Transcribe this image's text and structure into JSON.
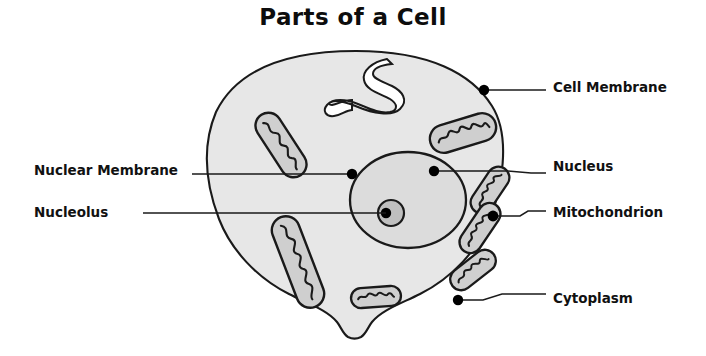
{
  "title": "Parts of a Cell",
  "colors": {
    "background": "#ffffff",
    "cytoplasm_fill": "#e7e7e7",
    "nucleus_fill": "#dcdcdc",
    "nucleolus_fill": "#bfbfbf",
    "mitochondrion_fill": "#cfcfcf",
    "organelle_channel_fill": "#ffffff",
    "outline": "#1a1a1a",
    "label_text": "#111111",
    "title_text": "#0d0d0d",
    "leader_line": "#1a1a1a",
    "anchor_dot": "#000000"
  },
  "labels": [
    {
      "id": "cell-membrane",
      "text": "Cell Membrane",
      "side": "right",
      "text_x": 553,
      "text_y": 88,
      "dot_x": 484,
      "dot_y": 90,
      "line_points": "484,90 546,90"
    },
    {
      "id": "nucleus",
      "text": "Nucleus",
      "side": "right",
      "text_x": 553,
      "text_y": 167,
      "dot_x": 434,
      "dot_y": 171,
      "line_points": "434,171 508,171 531,173 546,173"
    },
    {
      "id": "mitochondrion",
      "text": "Mitochondrion",
      "side": "right",
      "text_x": 553,
      "text_y": 213,
      "dot_x": 493,
      "dot_y": 216,
      "line_points": "493,216 520,216 528,211 546,211"
    },
    {
      "id": "cytoplasm",
      "text": "Cytoplasm",
      "side": "right",
      "text_x": 553,
      "text_y": 299,
      "dot_x": 458,
      "dot_y": 300,
      "line_points": "458,300 483,300 502,294 546,294"
    },
    {
      "id": "nuclear-membrane",
      "text": "Nuclear Membrane",
      "side": "left",
      "text_x": 184,
      "text_y": 171,
      "dot_x": 352,
      "dot_y": 174,
      "line_points": "352,174 192,174"
    },
    {
      "id": "nucleolus",
      "text": "Nucleolus",
      "side": "left",
      "text_x": 135,
      "text_y": 213,
      "dot_x": 386,
      "dot_y": 213,
      "line_points": "386,213 143,213"
    }
  ],
  "structures": {
    "cell_membrane": {
      "name": "cell-membrane",
      "center_x": 356,
      "center_y": 196,
      "radius": 145
    },
    "nucleus": {
      "name": "nucleus",
      "center_x": 408,
      "center_y": 200,
      "radius_x": 58,
      "radius_y": 48
    },
    "nucleolus": {
      "name": "nucleolus",
      "center_x": 391,
      "center_y": 213,
      "outer_radius": 13,
      "inner_radius": 5
    },
    "mitochondria_count": 7,
    "er_channel": {
      "name": "endoplasmic-channel",
      "description": "S-shaped white channel near top of cell"
    },
    "membrane_notch": {
      "name": "membrane-notch",
      "description": "indentation at bottom of cell membrane"
    }
  }
}
